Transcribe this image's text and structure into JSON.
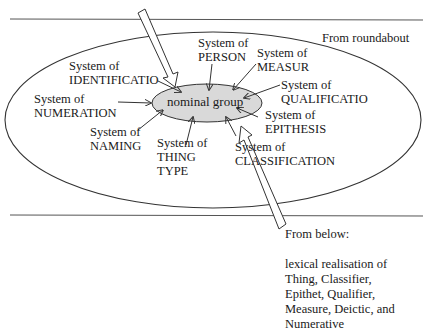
{
  "diagram": {
    "center": {
      "label": "nominal group",
      "fill": "#d9d9d9"
    },
    "regions": {
      "roundabout_label": "From roundabout",
      "below_label": "From below:",
      "below_description": [
        "lexical realisation of",
        "Thing, Classifier,",
        "Epithet, Qualifier,",
        "Measure, Deictic, and",
        "Numerative"
      ]
    },
    "systems": [
      {
        "id": "identification",
        "lines": [
          "System of",
          "IDENTIFICATIO"
        ]
      },
      {
        "id": "person",
        "lines": [
          "System of",
          "PERSON"
        ]
      },
      {
        "id": "measure",
        "lines": [
          "System of",
          "MEASUR"
        ]
      },
      {
        "id": "qualification",
        "lines": [
          "System of",
          "QUALIFICATIO"
        ]
      },
      {
        "id": "numeration",
        "lines": [
          "System of",
          "NUMERATION"
        ]
      },
      {
        "id": "epithesis",
        "lines": [
          "System of",
          "EPITHESIS"
        ]
      },
      {
        "id": "naming",
        "lines": [
          "System of",
          "NAMING"
        ]
      },
      {
        "id": "thing_type",
        "lines": [
          "System of",
          "THING",
          "TYPE"
        ]
      },
      {
        "id": "classification",
        "lines": [
          "System of",
          "CLASSIFICATION"
        ]
      }
    ],
    "colors": {
      "line": "#333333",
      "text": "#1a1a1a",
      "background": "#ffffff"
    }
  }
}
